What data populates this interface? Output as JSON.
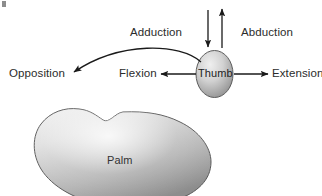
{
  "figure": {
    "type": "anatomical-motion-diagram",
    "background_color": "#ffffff",
    "stroke_color": "#1a1a1a",
    "shape_fill_light": "#e6e6e6",
    "shape_fill_dark": "#8f8f8f"
  },
  "nodes": {
    "thumb": {
      "label": "Thumb",
      "shape": "ellipse"
    },
    "palm": {
      "label": "Palm",
      "shape": "kidney"
    }
  },
  "labels": {
    "adduction": "Adduction",
    "abduction": "Abduction",
    "opposition": "Opposition",
    "flexion": "Flexion",
    "extension": "Extension"
  },
  "arrows": [
    {
      "name": "adduction-arrow",
      "from": "above-thumb",
      "to": "thumb",
      "direction": "down"
    },
    {
      "name": "abduction-arrow",
      "from": "thumb",
      "to": "above-thumb",
      "direction": "up"
    },
    {
      "name": "opposition-arrow",
      "from": "thumb",
      "to": "opposition",
      "direction": "curved-left"
    },
    {
      "name": "flexion-arrow",
      "from": "thumb",
      "to": "flexion",
      "direction": "left"
    },
    {
      "name": "extension-arrow",
      "from": "thumb",
      "to": "extension",
      "direction": "right"
    }
  ]
}
